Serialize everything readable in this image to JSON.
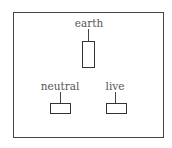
{
  "diagram": {
    "labels": {
      "earth": "earth",
      "neutral": "neutral",
      "live": "live"
    },
    "colors": {
      "outline": "#444444",
      "text": "#555555",
      "background": "#ffffff"
    }
  }
}
